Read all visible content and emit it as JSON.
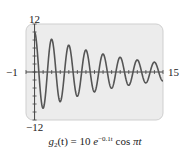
{
  "chart_data": {
    "type": "line",
    "title": "",
    "caption": {
      "func_name": "g",
      "func_sub": "2",
      "func_arg": "(t) = 10 ",
      "base": "e",
      "exponent": "−0.1t",
      "trig": " cos ",
      "trig_arg": "πt"
    },
    "function": "g2(t) = 10 e^(-0.1t) cos(pi t)",
    "xlim": [
      -1,
      15
    ],
    "ylim": [
      -12,
      12
    ],
    "x_tick_labels": {
      "left": "−1",
      "right": "15"
    },
    "y_tick_labels": {
      "top": "12",
      "bottom": "−12"
    },
    "x_tick_step": 1,
    "y_tick_step": 2,
    "grid": false,
    "legend": null,
    "series": [
      {
        "name": "g2(t)",
        "x": [
          0,
          1,
          2,
          3,
          4,
          5,
          6,
          7,
          8,
          9,
          10,
          11,
          12,
          13,
          14,
          15
        ],
        "values": [
          10,
          -9.05,
          8.19,
          -7.41,
          6.7,
          -6.07,
          5.49,
          -4.97,
          4.49,
          -4.07,
          3.68,
          -3.33,
          3.01,
          -2.73,
          2.47,
          -2.23
        ]
      }
    ],
    "colors": {
      "curve": "#555555",
      "axes": "#444444",
      "plot_bg": "#ececec",
      "plot_border": "#cfcfcf"
    }
  }
}
